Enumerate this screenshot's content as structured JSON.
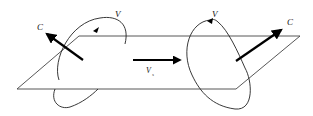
{
  "diagram": {
    "labels": {
      "left_vortex": "V",
      "left_axis": "C",
      "translation": "V",
      "translation_subscript": "s",
      "right_vortex": "V",
      "right_axis": "C"
    },
    "colors": {
      "stroke": "#222222",
      "arrow": "#000000",
      "background": "#ffffff"
    }
  }
}
